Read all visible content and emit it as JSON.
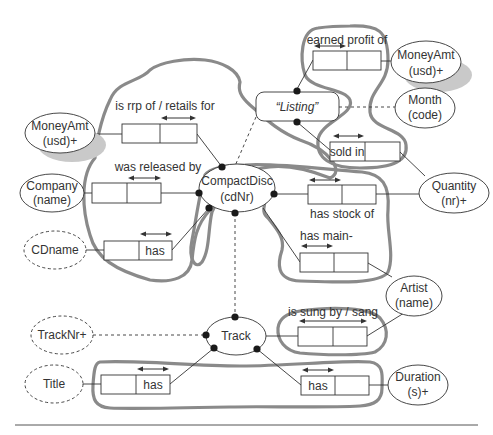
{
  "diagram": {
    "type": "ORM schema",
    "entities": {
      "compact_disc": {
        "name": "CompactDisc",
        "ref": "(cdNr)"
      },
      "track": {
        "name": "Track",
        "ref": ""
      },
      "listing": {
        "name": "“Listing”"
      },
      "money_amt_left": {
        "name": "MoneyAmt",
        "ref": "(usd)+"
      },
      "money_amt_right": {
        "name": "MoneyAmt",
        "ref": "(usd)+"
      },
      "month": {
        "name": "Month",
        "ref": "(code)"
      },
      "quantity": {
        "name": "Quantity",
        "ref": "(nr)+"
      },
      "company": {
        "name": "Company",
        "ref": "(name)"
      },
      "cdname": {
        "name": "CDname"
      },
      "artist": {
        "name": "Artist",
        "ref": "(name)"
      },
      "tracknr": {
        "name": "TrackNr+"
      },
      "title": {
        "name": "Title"
      },
      "duration": {
        "name": "Duration",
        "ref": "(s)+"
      }
    },
    "fact_types": {
      "earned_profit": {
        "reading": "earned profit of"
      },
      "retails_for": {
        "reading": "is rrp of / retails for"
      },
      "released_by": {
        "reading": "was released by"
      },
      "sold_in": {
        "reading": "sold in"
      },
      "has_stock": {
        "reading": "has stock of"
      },
      "has_main": {
        "reading": "has main-"
      },
      "cd_has_name": {
        "reading": "has"
      },
      "sung_by": {
        "reading": "is sung by / sang"
      },
      "track_title": {
        "reading": "has"
      },
      "track_duration": {
        "reading": "has"
      }
    },
    "colors": {
      "blob_outline": "#8a8a8a",
      "line": "#333333",
      "dot": "#1a1a1a",
      "shadow": "#c9c9c9"
    }
  }
}
